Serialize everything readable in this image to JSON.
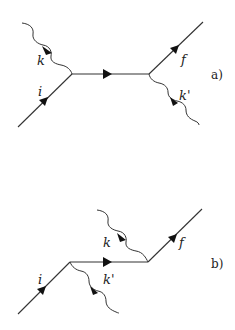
{
  "diagrams": [
    {
      "tag": "a)",
      "labels": {
        "photon_in": "k",
        "fermion_in": "i",
        "fermion_out": "f",
        "photon_out": "k'"
      }
    },
    {
      "tag": "b)",
      "labels": {
        "photon_in": "k",
        "fermion_in": "i",
        "fermion_out": "f",
        "photon_out": "k'"
      }
    }
  ],
  "colors": {
    "line": "#333333",
    "arrow": "#111111",
    "background": "#ffffff"
  }
}
